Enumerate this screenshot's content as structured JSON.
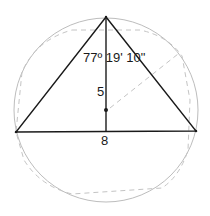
{
  "diagram": {
    "labels": {
      "apex_angle": "77º 19' 10\"",
      "height": "5",
      "base": "8"
    },
    "colors": {
      "triangle": "#1a1a1a",
      "circle": "#bdbdbd",
      "dashed": "#c4c4c4",
      "background": "#ffffff"
    },
    "points": {
      "apex": [
        106,
        17
      ],
      "base_left": [
        16,
        132
      ],
      "base_right": [
        196,
        131
      ],
      "foot": [
        106,
        131
      ],
      "center_dot": [
        106,
        110
      ]
    },
    "circle": {
      "cx": 106,
      "cy": 110,
      "r": 92
    }
  }
}
